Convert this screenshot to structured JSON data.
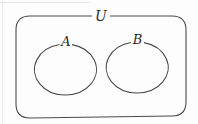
{
  "diagram": {
    "type": "venn",
    "universe": {
      "label": "U",
      "x": 16,
      "y": 16,
      "width": 170,
      "height": 101,
      "corner_radius": 14
    },
    "sets": [
      {
        "label": "A",
        "cx": 65.5,
        "cy": 69.5,
        "rx": 31,
        "ry": 25.5,
        "label_x": 66,
        "label_y": 45
      },
      {
        "label": "B",
        "cx": 137.5,
        "cy": 67.5,
        "rx": 31,
        "ry": 25.5,
        "label_x": 137.5,
        "label_y": 43
      }
    ],
    "colors": {
      "stroke": "#4a4a4a",
      "text": "#2a2a2a",
      "background": "#fdfdfd"
    }
  }
}
